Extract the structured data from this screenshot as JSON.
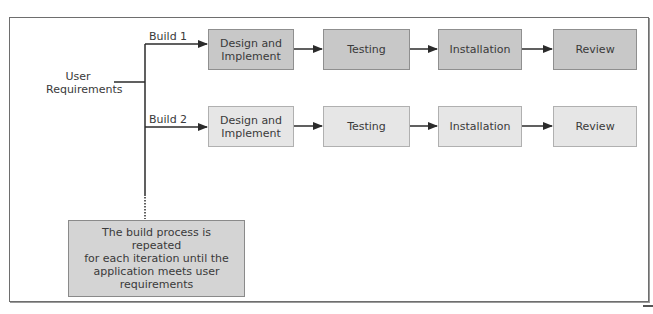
{
  "diagram": {
    "type": "iterative-development-process",
    "input": {
      "label_line1": "User",
      "label_line2": "Requirements"
    },
    "builds": [
      {
        "label": "Build 1",
        "shade": "#c8c8c8",
        "steps": [
          {
            "line1": "Design and",
            "line2": "Implement"
          },
          {
            "line1": "Testing",
            "line2": ""
          },
          {
            "line1": "Installation",
            "line2": ""
          },
          {
            "line1": "Review",
            "line2": ""
          }
        ]
      },
      {
        "label": "Build 2",
        "shade": "#e6e6e6",
        "steps": [
          {
            "line1": "Design and",
            "line2": "Implement"
          },
          {
            "line1": "Testing",
            "line2": ""
          },
          {
            "line1": "Installation",
            "line2": ""
          },
          {
            "line1": "Review",
            "line2": ""
          }
        ]
      }
    ],
    "note": {
      "line1": "The build process is repeated",
      "line2": "for each iteration until the",
      "line3": "application meets user",
      "line4": "requirements"
    }
  },
  "colors": {
    "line": "#2b2b2b",
    "frame_border": "#6e6e6e",
    "build1_fill": "#c8c8c8",
    "build2_fill": "#e6e6e6",
    "note_fill": "#d4d4d4",
    "text": "#3a3a3a"
  }
}
